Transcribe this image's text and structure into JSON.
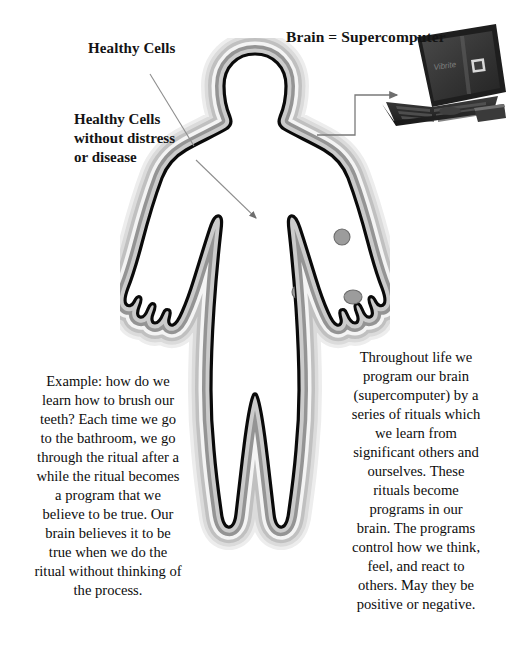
{
  "page": {
    "width": 509,
    "height": 660,
    "background": "#ffffff"
  },
  "labels": {
    "healthy_cells": "Healthy Cells",
    "healthy_cells_detail": "Healthy Cells\nwithout distress\nor disease",
    "healthy_cells_detail_lines": [
      "Healthy Cells",
      "without distress",
      "or disease"
    ],
    "brain_supercomputer": "Brain = Supercomputer"
  },
  "paragraphs": {
    "left": {
      "name": "example-ritual-paragraph",
      "text": "Example: how do we learn how to brush our teeth? Each time we go to the bathroom, we go through the ritual after a while the ritual becomes a program that we believe to be true. Our brain believes it to be true when we do the ritual without thinking of the process.",
      "lines": [
        "Example: how do we",
        "learn how to brush our",
        "teeth? Each time we go",
        "to the bathroom, we go",
        "through the ritual after a",
        "while the ritual becomes",
        "a program that we",
        "believe to be true. Our",
        "brain believes it to be",
        "true when we do the",
        "ritual without thinking of",
        "the process."
      ]
    },
    "right": {
      "name": "brain-programming-paragraph",
      "text": "Throughout life we program our brain (supercomputer) by a series of rituals which we learn from significant others and ourselves. These rituals become programs in our brain. The programs control how we think, feel, and react to others. May they be positive or negative.",
      "lines": [
        "Throughout life we",
        "program our brain",
        "(supercomputer) by a",
        "series of rituals which",
        "we learn from",
        "significant others and",
        "ourselves. These",
        "rituals become",
        "programs in our",
        "brain. The programs",
        "control how we think,",
        "feel, and react to",
        "others. May they be",
        "positive or negative."
      ]
    }
  },
  "figure": {
    "name": "human-silhouette-with-aura",
    "outline_color": "#0a0a0a",
    "fill_color": "#ffffff",
    "aura_colors": [
      "#b8b8b8",
      "#f2f2f2",
      "#8e8e8e",
      "#d8d8d8",
      "#e8e8e8"
    ],
    "cells": [
      {
        "cx": 222,
        "cy": 199,
        "rx": 8,
        "ry": 8,
        "label": "cell"
      },
      {
        "cx": 272,
        "cy": 160,
        "rx": 7.5,
        "ry": 7.5,
        "label": "cell"
      },
      {
        "cx": 233,
        "cy": 259,
        "rx": 9,
        "ry": 7,
        "label": "cell"
      },
      {
        "cx": 178,
        "cy": 254,
        "rx": 6,
        "ry": 6.5,
        "label": "cell"
      },
      {
        "cx": 303,
        "cy": 256,
        "rx": 6.5,
        "ry": 7,
        "label": "cell"
      },
      {
        "cx": 262,
        "cy": 288,
        "rx": 9.5,
        "ry": 7,
        "label": "cell"
      },
      {
        "cx": 229,
        "cy": 352,
        "rx": 8,
        "ry": 7.5,
        "label": "cell"
      },
      {
        "cx": 292,
        "cy": 350,
        "rx": 7.5,
        "ry": 7.5,
        "label": "cell"
      },
      {
        "cx": 278,
        "cy": 382,
        "rx": 9,
        "ry": 8,
        "label": "cell"
      },
      {
        "cx": 214,
        "cy": 447,
        "rx": 5,
        "ry": 7,
        "label": "cell"
      }
    ],
    "cell_fill": "#9c9c9c",
    "cell_stroke": "#6d6d6d"
  },
  "laptop": {
    "name": "laptop-supercomputer",
    "screen_brand_text": "Vibrite",
    "body_color": "#2b2b2b",
    "screen_color": "#3a3a3a"
  },
  "pointers": {
    "healthy_cells_line": "diagonal leader line from Healthy Cells label to aura edge",
    "cell_arrow": "arrow from upper-left into torso pointing at a cell",
    "brain_connector": "elbow arrow from head to laptop",
    "line_color": "#8a8a8a"
  }
}
